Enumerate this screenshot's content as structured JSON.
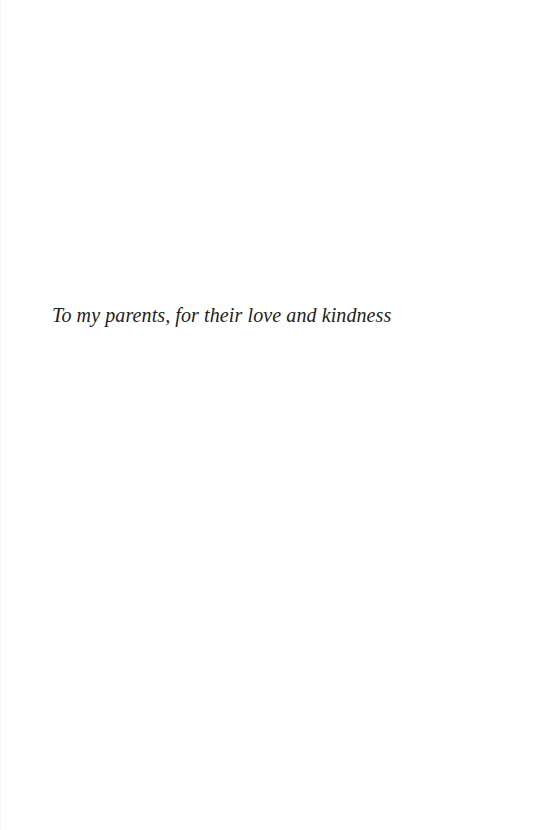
{
  "page": {
    "type": "dedication",
    "dedication_text": "To my parents, for their love and kindness",
    "colors": {
      "background": "#ffffff",
      "text": "#222222"
    }
  }
}
